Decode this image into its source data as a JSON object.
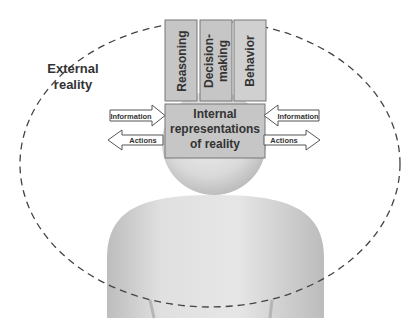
{
  "external": {
    "line1": "External",
    "line2": "reality"
  },
  "top_boxes": [
    {
      "label": "Reasoning"
    },
    {
      "label_line1": "Decision-",
      "label_line2": "making"
    },
    {
      "label": "Behavior"
    }
  ],
  "internal_box": {
    "line1": "Internal",
    "line2": "representations",
    "line3": "of reality"
  },
  "arrows": {
    "left_info": "Information",
    "left_actions": "Actions",
    "right_info": "Information",
    "right_actions": "Actions"
  },
  "colors": {
    "box_fill": "#c8c8c8",
    "box_stroke": "#777777",
    "figure": "#dcdcdc",
    "dash": "#444444",
    "text": "#333333"
  }
}
